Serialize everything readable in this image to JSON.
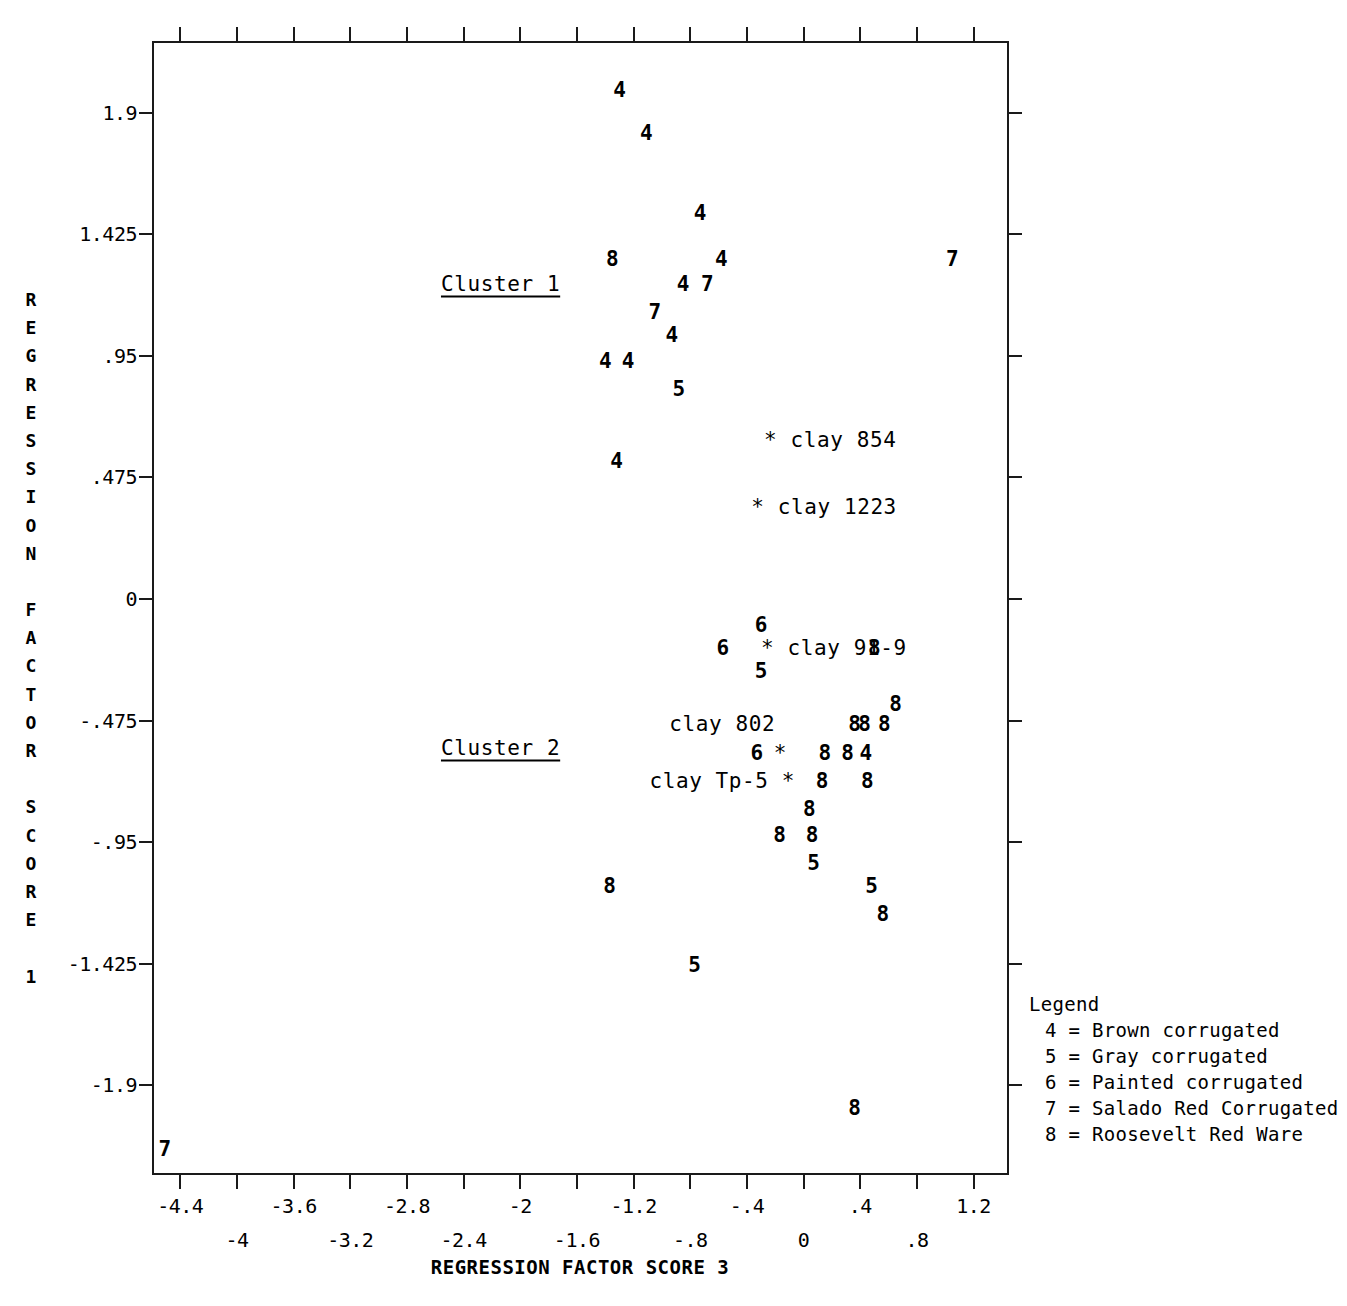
{
  "chart_data": {
    "type": "scatter",
    "title": "",
    "xlabel": "REGRESSION FACTOR SCORE 3",
    "ylabel": "REGRESSION FACTOR SCORE 1",
    "xlim": [
      -4.6,
      1.45
    ],
    "ylim": [
      -2.25,
      2.18
    ],
    "grid": false,
    "legend_position": "right-bottom-outside",
    "x_ticks_upper": [
      "-4.4",
      "-3.6",
      "-2.8",
      "-2",
      "-1.2",
      "-.4",
      ".4",
      "1.2"
    ],
    "x_ticks_lower": [
      "-4",
      "-3.2",
      "-2.4",
      "-1.6",
      "-.8",
      "0",
      ".8"
    ],
    "x_tick_values_upper": [
      -4.4,
      -3.6,
      -2.8,
      -2,
      -1.2,
      -0.4,
      0.4,
      1.2
    ],
    "x_tick_values_lower": [
      -4,
      -3.2,
      -2.4,
      -1.6,
      -0.8,
      0,
      0.8
    ],
    "y_ticks": [
      "1.9",
      "1.425",
      ".95",
      ".475",
      "0",
      "-.475",
      "-.95",
      "-1.425",
      "-1.9"
    ],
    "y_tick_values": [
      1.9,
      1.425,
      0.95,
      0.475,
      0,
      -0.475,
      -0.95,
      -1.425,
      -1.9
    ],
    "point_labels_meaning": {
      "4": "Brown corrugated",
      "5": "Gray corrugated",
      "6": "Painted corrugated",
      "7": "Salado Red Corrugated",
      "8": "Roosevelt Red Ware"
    },
    "points": [
      {
        "label": "4",
        "x": -1.3,
        "y": 1.99
      },
      {
        "label": "4",
        "x": -1.11,
        "y": 1.82
      },
      {
        "label": "4",
        "x": -0.73,
        "y": 1.51
      },
      {
        "label": "8",
        "x": -1.35,
        "y": 1.33
      },
      {
        "label": "4",
        "x": -0.58,
        "y": 1.33
      },
      {
        "label": "7",
        "x": 1.05,
        "y": 1.33
      },
      {
        "label": "4",
        "x": -0.85,
        "y": 1.23
      },
      {
        "label": "7",
        "x": -0.68,
        "y": 1.23
      },
      {
        "label": "7",
        "x": -1.05,
        "y": 1.12
      },
      {
        "label": "4",
        "x": -0.93,
        "y": 1.03
      },
      {
        "label": "4",
        "x": -1.4,
        "y": 0.93
      },
      {
        "label": "4",
        "x": -1.24,
        "y": 0.93
      },
      {
        "label": "5",
        "x": -0.88,
        "y": 0.82
      },
      {
        "label": "4",
        "x": -1.32,
        "y": 0.54
      },
      {
        "label": "6",
        "x": -0.3,
        "y": -0.1
      },
      {
        "label": "6",
        "x": -0.57,
        "y": -0.19
      },
      {
        "label": "8",
        "x": 0.5,
        "y": -0.19
      },
      {
        "label": "5",
        "x": -0.3,
        "y": -0.28
      },
      {
        "label": "8",
        "x": 0.65,
        "y": -0.41
      },
      {
        "label": "8",
        "x": 0.36,
        "y": -0.49
      },
      {
        "label": "8",
        "x": 0.43,
        "y": -0.49
      },
      {
        "label": "8",
        "x": 0.57,
        "y": -0.49
      },
      {
        "label": "6",
        "x": -0.33,
        "y": -0.6
      },
      {
        "label": "8",
        "x": 0.15,
        "y": -0.6
      },
      {
        "label": "8",
        "x": 0.31,
        "y": -0.6
      },
      {
        "label": "4",
        "x": 0.44,
        "y": -0.6
      },
      {
        "label": "8",
        "x": 0.13,
        "y": -0.71
      },
      {
        "label": "8",
        "x": 0.45,
        "y": -0.71
      },
      {
        "label": "8",
        "x": 0.04,
        "y": -0.82
      },
      {
        "label": "8",
        "x": -0.17,
        "y": -0.92
      },
      {
        "label": "8",
        "x": 0.06,
        "y": -0.92
      },
      {
        "label": "5",
        "x": 0.07,
        "y": -1.03
      },
      {
        "label": "8",
        "x": -1.37,
        "y": -1.12
      },
      {
        "label": "5",
        "x": 0.48,
        "y": -1.12
      },
      {
        "label": "8",
        "x": 0.56,
        "y": -1.23
      },
      {
        "label": "5",
        "x": -0.77,
        "y": -1.43
      },
      {
        "label": "8",
        "x": 0.36,
        "y": -1.99
      },
      {
        "label": "7",
        "x": -4.51,
        "y": -2.15
      }
    ],
    "annotations": [
      {
        "text": "* clay 854",
        "x": -0.28,
        "y": 0.62,
        "align": "left"
      },
      {
        "text": "* clay 1223",
        "x": -0.37,
        "y": 0.36,
        "align": "left"
      },
      {
        "text": "* clay 91-9",
        "x": -0.3,
        "y": -0.19,
        "align": "left"
      },
      {
        "text": "clay 802",
        "x": -0.2,
        "y": -0.49,
        "align": "right"
      },
      {
        "text": "*",
        "x": -0.21,
        "y": -0.6,
        "align": "left"
      },
      {
        "text": "clay Tp-5  *",
        "x": -0.06,
        "y": -0.71,
        "align": "right"
      }
    ],
    "cluster_labels": [
      {
        "text": "Cluster 1",
        "x": -2.56,
        "y": 1.23
      },
      {
        "text": "Cluster 2",
        "x": -2.56,
        "y": -0.58
      }
    ]
  },
  "legend": {
    "title": "Legend",
    "rows": [
      "4 = Brown corrugated",
      "5 = Gray corrugated",
      "6 = Painted corrugated",
      "7 = Salado Red Corrugated",
      "8 = Roosevelt Red Ware"
    ]
  },
  "axes": {
    "y_title_chars": [
      "R",
      "E",
      "G",
      "R",
      "E",
      "S",
      "S",
      "I",
      "O",
      "N",
      "",
      "F",
      "A",
      "C",
      "T",
      "O",
      "R",
      "",
      "S",
      "C",
      "O",
      "R",
      "E",
      "",
      "1"
    ],
    "x_title": "REGRESSION FACTOR SCORE 3"
  },
  "colors": {
    "ink": "#000000",
    "frame": "#1a1a1a",
    "background": "#ffffff"
  }
}
